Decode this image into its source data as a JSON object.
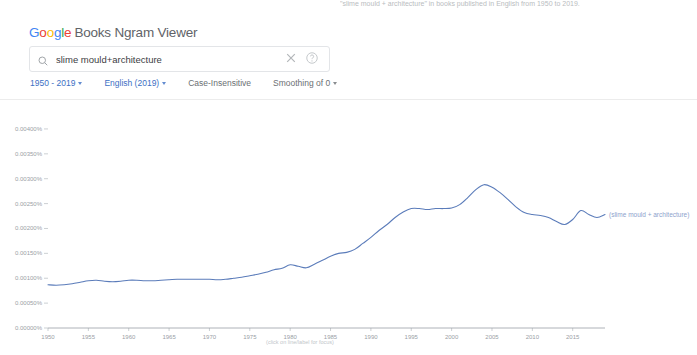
{
  "top_caption": "\"slime mould + architecture\" in books published in English from 1950 to 2019.",
  "header": {
    "logo_letters": [
      "G",
      "o",
      "o",
      "g",
      "l",
      "e"
    ],
    "logo_rest": "Books Ngram Viewer"
  },
  "search": {
    "value": "slime mould+architecture",
    "placeholder": "Search in Google Books Ngram Viewer",
    "search_icon": "search-icon",
    "clear_icon": "close-icon",
    "help_icon": "help-icon"
  },
  "options": {
    "year_range": "1950 - 2019",
    "corpus": "English (2019)",
    "case": "Case-Insensitive",
    "smoothing": "Smoothing of 0"
  },
  "chart_footer": "(click on line/label for focus)",
  "colors": {
    "line": "#5b7cba",
    "series_label": "#8da2cc",
    "axis_text": "#9aa0a6",
    "axis_line": "#9aa0a6",
    "link": "#3c6fc4"
  },
  "chart_data": {
    "type": "line",
    "title": "",
    "xlabel": "",
    "ylabel": "",
    "xlim": [
      1950,
      2019
    ],
    "ylim": [
      0.0,
      0.0042
    ],
    "grid": false,
    "legend_position": "right",
    "y_tick_labels": [
      "0.00400%",
      "0.00350%",
      "0.00300%",
      "0.00250%",
      "0.00200%",
      "0.00150%",
      "0.00100%",
      "0.00050%",
      "0.00000%"
    ],
    "y_tick_values": [
      0.004,
      0.0035,
      0.003,
      0.0025,
      0.002,
      0.0015,
      0.001,
      0.0005,
      0.0
    ],
    "x_tick_labels": [
      "1950",
      "1955",
      "1960",
      "1965",
      "1970",
      "1975",
      "1980",
      "1985",
      "1990",
      "1995",
      "2000",
      "2005",
      "2010",
      "2015"
    ],
    "x_tick_values": [
      1950,
      1955,
      1960,
      1965,
      1970,
      1975,
      1980,
      1985,
      1990,
      1995,
      2000,
      2005,
      2010,
      2015
    ],
    "series": [
      {
        "name": "(slime mould + architecture)",
        "color": "#5b7cba",
        "x": [
          1950,
          1951,
          1952,
          1953,
          1954,
          1955,
          1956,
          1957,
          1958,
          1959,
          1960,
          1961,
          1962,
          1963,
          1964,
          1965,
          1966,
          1967,
          1968,
          1969,
          1970,
          1971,
          1972,
          1973,
          1974,
          1975,
          1976,
          1977,
          1978,
          1979,
          1980,
          1981,
          1982,
          1983,
          1984,
          1985,
          1986,
          1987,
          1988,
          1989,
          1990,
          1991,
          1992,
          1993,
          1994,
          1995,
          1996,
          1997,
          1998,
          1999,
          2000,
          2001,
          2002,
          2003,
          2004,
          2005,
          2006,
          2007,
          2008,
          2009,
          2010,
          2011,
          2012,
          2013,
          2014,
          2015,
          2016,
          2017,
          2018,
          2019
        ],
        "values": [
          0.00087,
          0.00086,
          0.00087,
          0.00089,
          0.00092,
          0.00095,
          0.00096,
          0.00094,
          0.00093,
          0.00094,
          0.00096,
          0.00096,
          0.00095,
          0.00095,
          0.00096,
          0.00097,
          0.00098,
          0.00098,
          0.00098,
          0.00098,
          0.00098,
          0.00097,
          0.00098,
          0.001,
          0.00102,
          0.00105,
          0.00108,
          0.00112,
          0.00117,
          0.0012,
          0.00127,
          0.00124,
          0.00121,
          0.00128,
          0.00136,
          0.00144,
          0.0015,
          0.00152,
          0.00158,
          0.0017,
          0.00182,
          0.00196,
          0.00208,
          0.00222,
          0.00233,
          0.0024,
          0.0024,
          0.00238,
          0.0024,
          0.0024,
          0.00241,
          0.00248,
          0.00262,
          0.00278,
          0.00288,
          0.00283,
          0.00272,
          0.00258,
          0.00243,
          0.00232,
          0.00228,
          0.00226,
          0.00222,
          0.00214,
          0.00208,
          0.00218,
          0.00236,
          0.00228,
          0.00222,
          0.00228
        ]
      }
    ]
  }
}
